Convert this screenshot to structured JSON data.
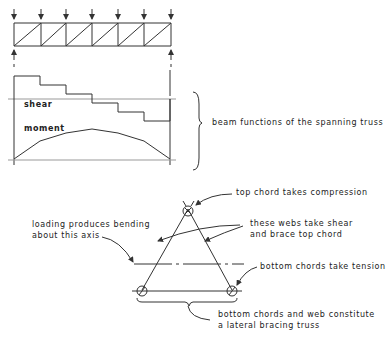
{
  "diagram": {
    "truss": {
      "load_arrows_x": [
        14,
        41,
        66,
        92,
        118,
        144,
        171
      ],
      "top_y": 23,
      "bottom_y": 46,
      "left_x": 14,
      "right_x": 171
    },
    "labels": {
      "shear": "shear",
      "moment": "moment",
      "beam_functions": "beam functions of the spanning truss",
      "top_chord": "top chord takes compression",
      "webs_line1": "these webs take shear",
      "webs_line2": "and brace top chord",
      "loading_line1": "loading produces bending",
      "loading_line2": "about this axis",
      "bottom_chords": "bottom chords take tension",
      "lateral_line1": "bottom chords and web constitute",
      "lateral_line2": "a lateral bracing truss"
    },
    "shear_steps_y": [
      76,
      85,
      94,
      103,
      112,
      121
    ],
    "moment_points": [
      [
        14,
        159
      ],
      [
        40,
        141
      ],
      [
        66,
        133
      ],
      [
        92,
        129
      ],
      [
        118,
        133
      ],
      [
        144,
        141
      ],
      [
        170,
        159
      ]
    ],
    "colors": {
      "line": "#333333",
      "background": "#ffffff"
    }
  }
}
